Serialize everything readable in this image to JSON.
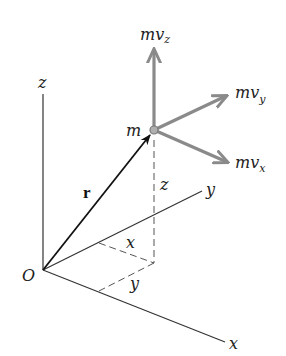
{
  "diagram": {
    "colors": {
      "axis": "#333333",
      "vector": "#111111",
      "momentum": "#8a8a8a",
      "dashed": "#555555",
      "background": "#ffffff"
    },
    "axes": {
      "origin_label": "O",
      "x_label": "x",
      "y_label": "y",
      "z_label": "z"
    },
    "position_vector": {
      "label": "r"
    },
    "particle": {
      "label": "m"
    },
    "coordinates": {
      "x_label": "x",
      "y_label": "y",
      "z_label": "z"
    },
    "momentum_components": [
      {
        "id": "mvz",
        "base": "mv",
        "subscript": "z"
      },
      {
        "id": "mvy",
        "base": "mv",
        "subscript": "y"
      },
      {
        "id": "mvx",
        "base": "mv",
        "subscript": "x"
      }
    ]
  }
}
